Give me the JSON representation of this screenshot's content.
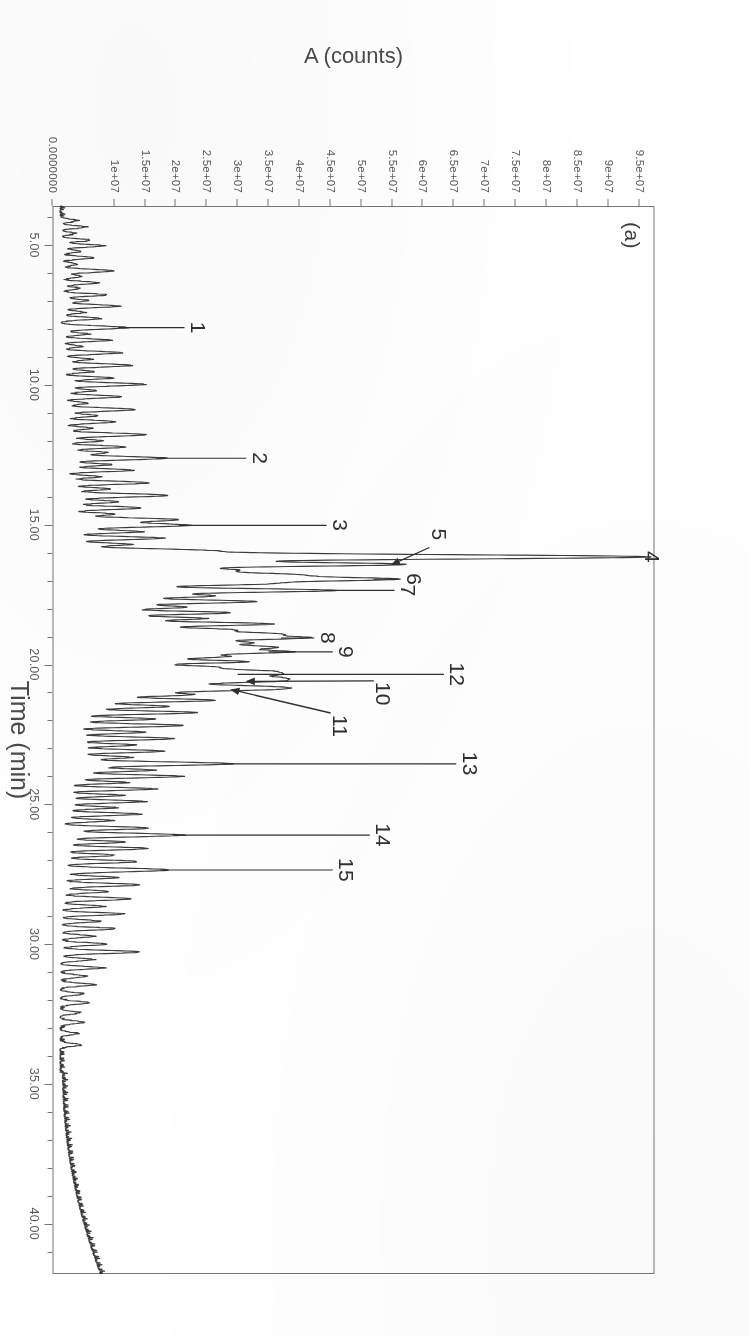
{
  "figure": {
    "panel_tag": "(a)",
    "rotation_note_hidden": ""
  },
  "chart_data": {
    "type": "line",
    "title": "",
    "subtitle": "",
    "xlabel": "Time (min)",
    "ylabel": "A (counts)",
    "xlim": [
      3.6,
      41.8
    ],
    "ylim": [
      0,
      97500000
    ],
    "grid": false,
    "legend_position": "none",
    "xticks": [
      5.0,
      10.0,
      15.0,
      20.0,
      25.0,
      30.0,
      35.0,
      40.0
    ],
    "xtick_labels": [
      "5.00",
      "10.00",
      "15.00",
      "20.00",
      "25.00",
      "30.00",
      "35.00",
      "40.00"
    ],
    "xtick_minor_step": 1.0,
    "yticks": [
      0,
      10000000,
      15000000,
      20000000,
      25000000,
      30000000,
      35000000,
      40000000,
      45000000,
      50000000,
      55000000,
      60000000,
      65000000,
      70000000,
      75000000,
      80000000,
      85000000,
      90000000,
      95000000
    ],
    "ytick_labels": [
      "0.0000000",
      "1e+07",
      "1.5e+07",
      "2e+07",
      "2.5e+07",
      "3e+07",
      "3.5e+07",
      "4e+07",
      "4.5e+07",
      "5e+07",
      "5.5e+07",
      "6e+07",
      "6.5e+07",
      "7e+07",
      "7.5e+07",
      "8e+07",
      "8.5e+07",
      "9e+07",
      "9.5e+07"
    ],
    "series": [
      {
        "name": "Total ion chromatogram",
        "color": "#3c3c3c",
        "baseline": 1200000
      }
    ],
    "annotations": [
      {
        "id": "1",
        "label": "1",
        "time": 7.95,
        "height": 10600000,
        "leader": "line",
        "label_time": 7.95,
        "label_value": 23500000
      },
      {
        "id": "2",
        "label": "2",
        "time": 12.62,
        "height": 16800000,
        "leader": "line",
        "label_time": 12.62,
        "label_value": 33500000
      },
      {
        "id": "3",
        "label": "3",
        "time": 15.02,
        "height": 20500000,
        "leader": "line",
        "label_time": 15.02,
        "label_value": 46500000
      },
      {
        "id": "4",
        "label": "4",
        "time": 16.15,
        "height": 95000000,
        "leader": "line",
        "label_time": 16.15,
        "label_value": 97000000
      },
      {
        "id": "5",
        "label": "5",
        "time": 16.42,
        "height": 55000000,
        "leader": "arrow",
        "label_time": 15.35,
        "label_value": 62500000
      },
      {
        "id": "6",
        "label": "6",
        "time": 16.95,
        "height": 52000000,
        "leader": "line",
        "label_time": 16.95,
        "label_value": 58500000
      },
      {
        "id": "7",
        "label": "7",
        "time": 17.35,
        "height": 44000000,
        "leader": "line",
        "label_time": 17.35,
        "label_value": 57500000
      },
      {
        "id": "8",
        "label": "8",
        "time": 19.05,
        "height": 37000000,
        "leader": "line",
        "label_time": 19.05,
        "label_value": 44500000
      },
      {
        "id": "9",
        "label": "9",
        "time": 19.55,
        "height": 35000000,
        "leader": "line",
        "label_time": 19.55,
        "label_value": 47500000
      },
      {
        "id": "10",
        "label": "10",
        "time": 20.6,
        "height": 31500000,
        "leader": "arrow",
        "label_time": 21.05,
        "label_value": 53500000
      },
      {
        "id": "11",
        "label": "11",
        "time": 20.9,
        "height": 29000000,
        "leader": "arrow",
        "label_time": 22.2,
        "label_value": 46500000
      },
      {
        "id": "12",
        "label": "12",
        "time": 20.35,
        "height": 30000000,
        "leader": "line",
        "label_time": 20.35,
        "label_value": 65500000
      },
      {
        "id": "13",
        "label": "13",
        "time": 23.55,
        "height": 27500000,
        "leader": "line",
        "label_time": 23.55,
        "label_value": 67500000
      },
      {
        "id": "14",
        "label": "14",
        "time": 26.1,
        "height": 19500000,
        "leader": "line",
        "label_time": 26.1,
        "label_value": 53500000
      },
      {
        "id": "15",
        "label": "15",
        "time": 27.35,
        "height": 17500000,
        "leader": "line",
        "label_time": 27.35,
        "label_value": 47500000
      }
    ],
    "peaks": [
      {
        "t": 4.12,
        "h": 2400000,
        "w": 0.055
      },
      {
        "t": 4.35,
        "h": 3900000,
        "w": 0.05
      },
      {
        "t": 4.58,
        "h": 2100000,
        "w": 0.05
      },
      {
        "t": 4.82,
        "h": 4600000,
        "w": 0.05
      },
      {
        "t": 5.02,
        "h": 6900000,
        "w": 0.05
      },
      {
        "t": 5.22,
        "h": 3200000,
        "w": 0.05
      },
      {
        "t": 5.45,
        "h": 5400000,
        "w": 0.05
      },
      {
        "t": 5.68,
        "h": 2700000,
        "w": 0.05
      },
      {
        "t": 5.92,
        "h": 8600000,
        "w": 0.055
      },
      {
        "t": 6.12,
        "h": 3400000,
        "w": 0.05
      },
      {
        "t": 6.35,
        "h": 6200000,
        "w": 0.05
      },
      {
        "t": 6.55,
        "h": 2900000,
        "w": 0.05
      },
      {
        "t": 6.78,
        "h": 7400000,
        "w": 0.05
      },
      {
        "t": 6.98,
        "h": 4100000,
        "w": 0.05
      },
      {
        "t": 7.18,
        "h": 9200000,
        "w": 0.055
      },
      {
        "t": 7.4,
        "h": 3700000,
        "w": 0.05
      },
      {
        "t": 7.62,
        "h": 6400000,
        "w": 0.05
      },
      {
        "t": 7.95,
        "h": 10600000,
        "w": 0.06
      },
      {
        "t": 8.18,
        "h": 4300000,
        "w": 0.05
      },
      {
        "t": 8.4,
        "h": 7800000,
        "w": 0.05
      },
      {
        "t": 8.62,
        "h": 3100000,
        "w": 0.05
      },
      {
        "t": 8.85,
        "h": 9500000,
        "w": 0.055
      },
      {
        "t": 9.08,
        "h": 4700000,
        "w": 0.05
      },
      {
        "t": 9.3,
        "h": 11200000,
        "w": 0.06
      },
      {
        "t": 9.52,
        "h": 5100000,
        "w": 0.05
      },
      {
        "t": 9.75,
        "h": 8300000,
        "w": 0.05
      },
      {
        "t": 9.98,
        "h": 13500000,
        "w": 0.06
      },
      {
        "t": 10.2,
        "h": 5600000,
        "w": 0.05
      },
      {
        "t": 10.42,
        "h": 9800000,
        "w": 0.055
      },
      {
        "t": 10.65,
        "h": 4400000,
        "w": 0.05
      },
      {
        "t": 10.88,
        "h": 12100000,
        "w": 0.06
      },
      {
        "t": 11.1,
        "h": 6100000,
        "w": 0.05
      },
      {
        "t": 11.32,
        "h": 8900000,
        "w": 0.055
      },
      {
        "t": 11.55,
        "h": 5200000,
        "w": 0.05
      },
      {
        "t": 11.78,
        "h": 13800000,
        "w": 0.06
      },
      {
        "t": 12.0,
        "h": 6700000,
        "w": 0.05
      },
      {
        "t": 12.22,
        "h": 10300000,
        "w": 0.055
      },
      {
        "t": 12.42,
        "h": 7200000,
        "w": 0.05
      },
      {
        "t": 12.62,
        "h": 16800000,
        "w": 0.065
      },
      {
        "t": 12.85,
        "h": 7900000,
        "w": 0.05
      },
      {
        "t": 13.05,
        "h": 11600000,
        "w": 0.055
      },
      {
        "t": 13.28,
        "h": 6300000,
        "w": 0.05
      },
      {
        "t": 13.5,
        "h": 14200000,
        "w": 0.06
      },
      {
        "t": 13.72,
        "h": 8100000,
        "w": 0.05
      },
      {
        "t": 13.95,
        "h": 17400000,
        "w": 0.065
      },
      {
        "t": 14.18,
        "h": 9400000,
        "w": 0.055
      },
      {
        "t": 14.4,
        "h": 13100000,
        "w": 0.06
      },
      {
        "t": 14.62,
        "h": 8700000,
        "w": 0.05
      },
      {
        "t": 14.82,
        "h": 18600000,
        "w": 0.065
      },
      {
        "t": 15.02,
        "h": 20500000,
        "w": 0.07
      },
      {
        "t": 15.25,
        "h": 12800000,
        "w": 0.055
      },
      {
        "t": 15.48,
        "h": 16200000,
        "w": 0.06
      },
      {
        "t": 15.7,
        "h": 10900000,
        "w": 0.055
      },
      {
        "t": 15.92,
        "h": 21700000,
        "w": 0.07
      },
      {
        "t": 16.15,
        "h": 95000000,
        "w": 0.085
      },
      {
        "t": 16.42,
        "h": 55000000,
        "w": 0.075
      },
      {
        "t": 16.62,
        "h": 24600000,
        "w": 0.065
      },
      {
        "t": 16.78,
        "h": 33400000,
        "w": 0.07
      },
      {
        "t": 16.95,
        "h": 52000000,
        "w": 0.075
      },
      {
        "t": 17.12,
        "h": 28900000,
        "w": 0.065
      },
      {
        "t": 17.35,
        "h": 44000000,
        "w": 0.075
      },
      {
        "t": 17.55,
        "h": 23100000,
        "w": 0.06
      },
      {
        "t": 17.75,
        "h": 31500000,
        "w": 0.07
      },
      {
        "t": 17.95,
        "h": 19800000,
        "w": 0.06
      },
      {
        "t": 18.15,
        "h": 27400000,
        "w": 0.065
      },
      {
        "t": 18.35,
        "h": 22600000,
        "w": 0.06
      },
      {
        "t": 18.55,
        "h": 33900000,
        "w": 0.07
      },
      {
        "t": 18.75,
        "h": 25100000,
        "w": 0.065
      },
      {
        "t": 18.9,
        "h": 30200000,
        "w": 0.065
      },
      {
        "t": 19.05,
        "h": 37000000,
        "w": 0.07
      },
      {
        "t": 19.22,
        "h": 26700000,
        "w": 0.065
      },
      {
        "t": 19.38,
        "h": 32100000,
        "w": 0.07
      },
      {
        "t": 19.55,
        "h": 35000000,
        "w": 0.07
      },
      {
        "t": 19.72,
        "h": 24300000,
        "w": 0.065
      },
      {
        "t": 19.9,
        "h": 29600000,
        "w": 0.065
      },
      {
        "t": 20.08,
        "h": 21900000,
        "w": 0.06
      },
      {
        "t": 20.22,
        "h": 26400000,
        "w": 0.065
      },
      {
        "t": 20.35,
        "h": 30000000,
        "w": 0.07
      },
      {
        "t": 20.48,
        "h": 23700000,
        "w": 0.06
      },
      {
        "t": 20.6,
        "h": 31500000,
        "w": 0.07
      },
      {
        "t": 20.78,
        "h": 25800000,
        "w": 0.065
      },
      {
        "t": 20.9,
        "h": 29000000,
        "w": 0.07
      },
      {
        "t": 21.08,
        "h": 20100000,
        "w": 0.06
      },
      {
        "t": 21.28,
        "h": 24900000,
        "w": 0.065
      },
      {
        "t": 21.5,
        "h": 17600000,
        "w": 0.06
      },
      {
        "t": 21.72,
        "h": 22200000,
        "w": 0.06
      },
      {
        "t": 21.95,
        "h": 15400000,
        "w": 0.055
      },
      {
        "t": 22.18,
        "h": 19900000,
        "w": 0.06
      },
      {
        "t": 22.42,
        "h": 13700000,
        "w": 0.055
      },
      {
        "t": 22.65,
        "h": 18300000,
        "w": 0.06
      },
      {
        "t": 22.88,
        "h": 12100000,
        "w": 0.055
      },
      {
        "t": 23.1,
        "h": 16500000,
        "w": 0.06
      },
      {
        "t": 23.32,
        "h": 11200000,
        "w": 0.055
      },
      {
        "t": 23.55,
        "h": 27500000,
        "w": 0.07
      },
      {
        "t": 23.78,
        "h": 14800000,
        "w": 0.055
      },
      {
        "t": 24.0,
        "h": 19400000,
        "w": 0.06
      },
      {
        "t": 24.22,
        "h": 10600000,
        "w": 0.05
      },
      {
        "t": 24.45,
        "h": 15100000,
        "w": 0.055
      },
      {
        "t": 24.68,
        "h": 9800000,
        "w": 0.05
      },
      {
        "t": 24.9,
        "h": 13400000,
        "w": 0.055
      },
      {
        "t": 25.12,
        "h": 8900000,
        "w": 0.05
      },
      {
        "t": 25.35,
        "h": 12700000,
        "w": 0.055
      },
      {
        "t": 25.58,
        "h": 8200000,
        "w": 0.05
      },
      {
        "t": 25.85,
        "h": 14100000,
        "w": 0.055
      },
      {
        "t": 26.1,
        "h": 19500000,
        "w": 0.065
      },
      {
        "t": 26.35,
        "h": 10200000,
        "w": 0.05
      },
      {
        "t": 26.58,
        "h": 13900000,
        "w": 0.055
      },
      {
        "t": 26.82,
        "h": 8600000,
        "w": 0.05
      },
      {
        "t": 27.05,
        "h": 12300000,
        "w": 0.055
      },
      {
        "t": 27.35,
        "h": 17500000,
        "w": 0.065
      },
      {
        "t": 27.62,
        "h": 9400000,
        "w": 0.05
      },
      {
        "t": 27.88,
        "h": 12900000,
        "w": 0.055
      },
      {
        "t": 28.12,
        "h": 7800000,
        "w": 0.05
      },
      {
        "t": 28.38,
        "h": 11400000,
        "w": 0.055
      },
      {
        "t": 28.65,
        "h": 6900000,
        "w": 0.05
      },
      {
        "t": 28.92,
        "h": 10100000,
        "w": 0.05
      },
      {
        "t": 29.18,
        "h": 6200000,
        "w": 0.05
      },
      {
        "t": 29.45,
        "h": 8800000,
        "w": 0.05
      },
      {
        "t": 29.72,
        "h": 5400000,
        "w": 0.05
      },
      {
        "t": 30.0,
        "h": 7600000,
        "w": 0.05
      },
      {
        "t": 30.28,
        "h": 12800000,
        "w": 0.055
      },
      {
        "t": 30.55,
        "h": 5100000,
        "w": 0.05
      },
      {
        "t": 30.85,
        "h": 6700000,
        "w": 0.05
      },
      {
        "t": 31.15,
        "h": 4200000,
        "w": 0.05
      },
      {
        "t": 31.45,
        "h": 5600000,
        "w": 0.05
      },
      {
        "t": 31.78,
        "h": 3500000,
        "w": 0.05
      },
      {
        "t": 32.1,
        "h": 4700000,
        "w": 0.05
      },
      {
        "t": 32.45,
        "h": 2900000,
        "w": 0.05
      },
      {
        "t": 32.8,
        "h": 3800000,
        "w": 0.05
      },
      {
        "t": 33.2,
        "h": 2500000,
        "w": 0.05
      },
      {
        "t": 33.6,
        "h": 3200000,
        "w": 0.05
      }
    ],
    "tail_rise": {
      "start_time": 34.6,
      "end_time": 41.6,
      "start_value": 1600000,
      "end_value": 7400000,
      "note": "solvent/column bleed rise at end of run"
    }
  }
}
